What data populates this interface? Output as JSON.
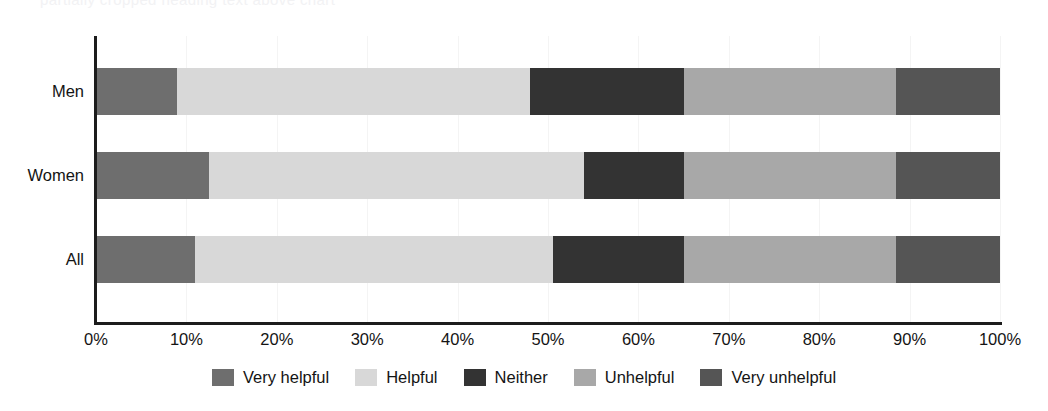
{
  "top_crop_text": "partially cropped heading text above chart",
  "chart_data": {
    "type": "bar",
    "orientation": "horizontal",
    "stacked": true,
    "stack_normalized_percent": true,
    "title": "",
    "subtitle": "",
    "xlabel": "",
    "ylabel": "",
    "xlim": [
      0,
      100
    ],
    "grid": true,
    "legend_position": "bottom",
    "categories": [
      "Men",
      "Women",
      "All"
    ],
    "tick_labels": [
      "0%",
      "10%",
      "20%",
      "30%",
      "40%",
      "50%",
      "60%",
      "70%",
      "80%",
      "90%",
      "100%"
    ],
    "tick_values": [
      0,
      10,
      20,
      30,
      40,
      50,
      60,
      70,
      80,
      90,
      100
    ],
    "series": [
      {
        "name": "Very helpful",
        "color": "#6e6e6e",
        "values": [
          9.0,
          12.5,
          11.0
        ]
      },
      {
        "name": "Helpful",
        "color": "#d8d8d8",
        "values": [
          39.0,
          41.5,
          39.5
        ]
      },
      {
        "name": "Neither",
        "color": "#333333",
        "values": [
          17.0,
          11.0,
          14.5
        ]
      },
      {
        "name": "Unhelpful",
        "color": "#a8a8a8",
        "values": [
          23.5,
          23.5,
          23.5
        ]
      },
      {
        "name": "Very unhelpful",
        "color": "#555555",
        "values": [
          11.5,
          11.5,
          11.5
        ]
      }
    ]
  },
  "legend": {
    "items": [
      {
        "label": "Very helpful",
        "color": "#6e6e6e"
      },
      {
        "label": "Helpful",
        "color": "#d8d8d8"
      },
      {
        "label": "Neither",
        "color": "#333333"
      },
      {
        "label": "Unhelpful",
        "color": "#a8a8a8"
      },
      {
        "label": "Very unhelpful",
        "color": "#555555"
      }
    ]
  },
  "axis": {
    "tick_labels": [
      "0%",
      "10%",
      "20%",
      "30%",
      "40%",
      "50%",
      "60%",
      "70%",
      "80%",
      "90%",
      "100%"
    ]
  },
  "rows": [
    {
      "label": "Men"
    },
    {
      "label": "Women"
    },
    {
      "label": "All"
    }
  ]
}
